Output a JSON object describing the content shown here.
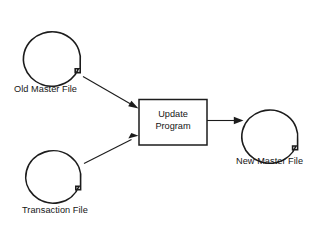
{
  "diagram": {
    "type": "system-flowchart",
    "background_color": "#ffffff",
    "stroke_color": "#1c1c1c",
    "nodes": [
      {
        "id": "old-master-file",
        "shape": "magnetic-tape",
        "label": "Old Master File",
        "label_x": 14,
        "label_y": 84
      },
      {
        "id": "transaction-file",
        "shape": "magnetic-tape",
        "label": "Transaction File",
        "label_x": 22,
        "label_y": 205
      },
      {
        "id": "update-program",
        "shape": "process-box",
        "label_line_1": "Update",
        "label_line_2": "Program"
      },
      {
        "id": "new-master-file",
        "shape": "magnetic-tape",
        "label": "New Master File",
        "label_x": 236,
        "label_y": 156
      }
    ],
    "edges": [
      {
        "id": "old-master-to-update",
        "from": "old-master-file",
        "to": "update-program"
      },
      {
        "id": "transaction-to-update",
        "from": "transaction-file",
        "to": "update-program"
      },
      {
        "id": "update-to-new-master",
        "from": "update-program",
        "to": "new-master-file"
      }
    ]
  }
}
